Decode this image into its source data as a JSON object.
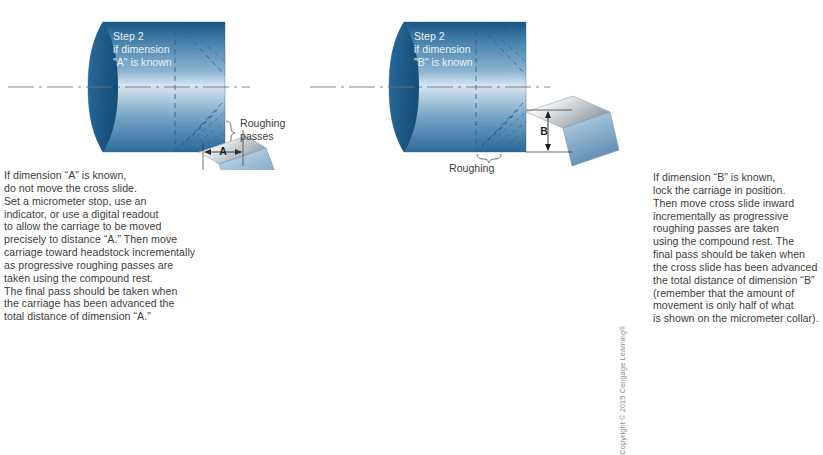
{
  "figure": {
    "background_color": "#ffffff",
    "body_text_color": "#3d3d3d"
  },
  "panels": [
    {
      "id": "left",
      "workpiece_label": "Step 2\nif dimension\n\"A\" is known",
      "bracket_label": "Roughing\npasses",
      "dimension_label": "A",
      "dimension_orientation": "horizontal",
      "caption": "If dimension “A” is known,\ndo not move the cross slide.\nSet a micrometer stop, use an\nindicator, or use a digital readout\nto allow the carriage to be moved\nprecisely to distance “A.” Then move\ncarriage toward headstock incrementally\nas progressive roughing passes are\ntaken using the compound rest.\nThe final pass should be taken when\nthe carriage has been advanced the\ntotal distance of dimension “A.”"
    },
    {
      "id": "right",
      "workpiece_label": "Step 2\nif dimension\n\"B\" is known",
      "bracket_label": "Roughing\npasses",
      "dimension_label": "B",
      "dimension_orientation": "vertical",
      "caption": "If dimension “B” is known,\nlock the carriage in position.\nThen move cross slide inward\nincrementally as progressive\nroughing passes are taken\nusing the compound rest. The\nfinal pass should be taken when\nthe cross slide has been advanced\nthe total distance of dimension “B”\n(remember that the amount of\nmovement is only half of what\nis shown on the micrometer collar)."
    }
  ],
  "colors": {
    "workpiece_dark_blue": "#1f5c8c",
    "workpiece_mid_blue": "#5b8fb9",
    "workpiece_light_blue": "#cfe0ec",
    "end_face_blue": "#1d5d8e",
    "tool_metal_light": "#f2f4f6",
    "tool_metal_gray": "#9aa3a9",
    "tool_blue": "#7fa8c9",
    "dash_line": "#2f5f8a",
    "center_line": "#7a7a7a",
    "bracket_line": "#6f6f6f"
  },
  "copyright": "Copyright © 2015 Cengage Learning®"
}
